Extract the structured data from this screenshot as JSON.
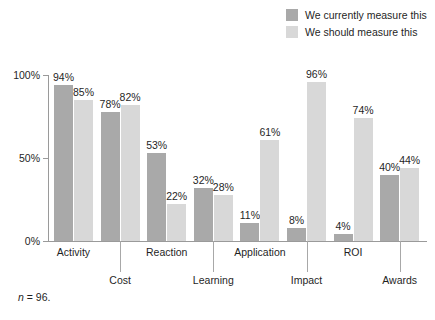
{
  "legend": {
    "position": "top-right",
    "items": [
      {
        "label": "We currently measure this",
        "color": "#a9a9a9",
        "swatch_name": "legend-swatch-currently"
      },
      {
        "label": "We should measure this",
        "color": "#d8d8d8",
        "swatch_name": "legend-swatch-should"
      }
    ]
  },
  "footnote": {
    "symbol": "n",
    "text": " = 96."
  },
  "chart_data": {
    "type": "bar",
    "title": "",
    "subtitle": "",
    "xlabel": "",
    "ylabel": "",
    "ylim": [
      0,
      100
    ],
    "grid": false,
    "legend_position": "top-right",
    "categories": [
      "Activity",
      "Cost",
      "Reaction",
      "Learning",
      "Application",
      "Impact",
      "ROI",
      "Awards"
    ],
    "ytick_labels": [
      "100%",
      "50%",
      "0%"
    ],
    "ytick_values": [
      100,
      50,
      0
    ],
    "series": [
      {
        "name": "We currently measure this",
        "color": "#a9a9a9",
        "values": [
          94,
          78,
          53,
          32,
          11,
          8,
          4,
          40
        ],
        "labels": [
          "94%",
          "78%",
          "53%",
          "32%",
          "11%",
          "8%",
          "4%",
          "40%"
        ]
      },
      {
        "name": "We should measure this",
        "color": "#d8d8d8",
        "values": [
          85,
          82,
          22,
          28,
          61,
          96,
          74,
          44
        ],
        "labels": [
          "85%",
          "82%",
          "22%",
          "28%",
          "61%",
          "96%",
          "74%",
          "44%"
        ]
      }
    ]
  }
}
